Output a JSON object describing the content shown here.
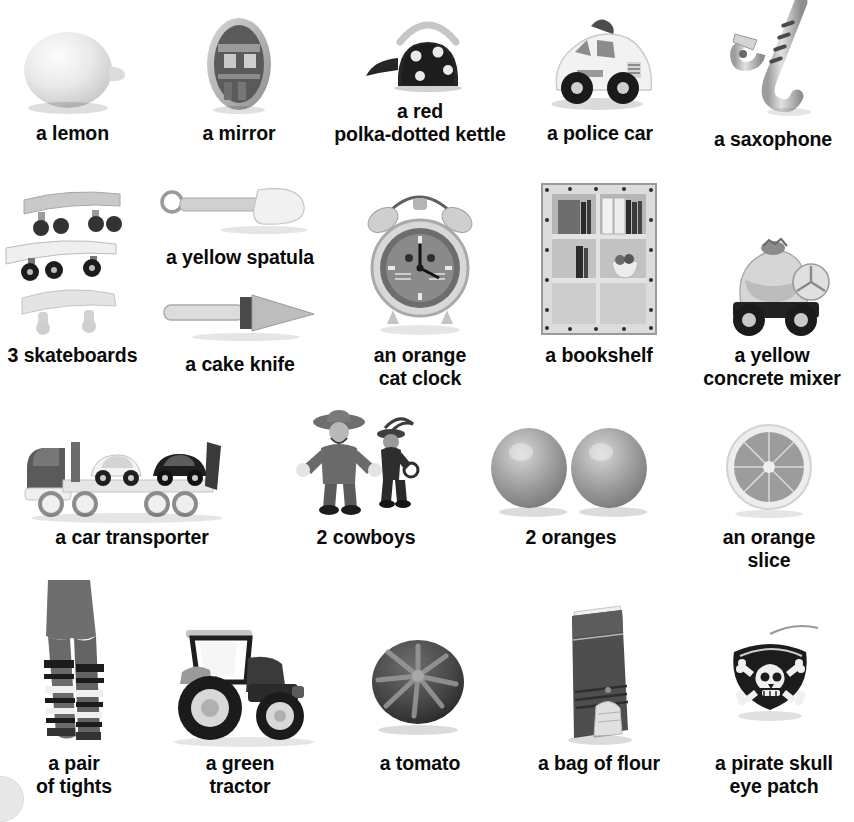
{
  "page": {
    "background_color": "#ffffff",
    "text_color": "#0a0a0a",
    "columns": 5,
    "rows": 4
  },
  "rows": [
    {
      "index": 1,
      "items": [
        {
          "caption": "a lemon",
          "icon": "lemon-icon",
          "col": 1
        },
        {
          "caption": "a mirror",
          "icon": "mirror-icon",
          "col": 2
        },
        {
          "caption": "a red\npolka-dotted kettle",
          "icon": "kettle-icon",
          "col": 3
        },
        {
          "caption": "a police car",
          "icon": "police-car-icon",
          "col": 4
        },
        {
          "caption": "a saxophone",
          "icon": "saxophone-icon",
          "col": 5
        }
      ]
    },
    {
      "index": 2,
      "items": [
        {
          "caption": "3 skateboards",
          "icon": "skateboards-icon",
          "col": 1
        },
        {
          "caption": "a yellow spatula",
          "icon": "spatula-icon",
          "col": 2
        },
        {
          "caption": "a cake knife",
          "icon": "cake-knife-icon",
          "col": 2
        },
        {
          "caption": "an orange\ncat clock",
          "icon": "cat-clock-icon",
          "col": 3
        },
        {
          "caption": "a bookshelf",
          "icon": "bookshelf-icon",
          "col": 4
        },
        {
          "caption": "a yellow\nconcrete mixer",
          "icon": "concrete-mixer-icon",
          "col": 5
        }
      ]
    },
    {
      "index": 3,
      "items": [
        {
          "caption": "a car transporter",
          "icon": "car-transporter-icon",
          "col": 1
        },
        {
          "caption": "2 cowboys",
          "icon": "cowboys-icon",
          "col": 2
        },
        {
          "caption": "2 oranges",
          "icon": "oranges-icon",
          "col": 3
        },
        {
          "caption": "an orange\nslice",
          "icon": "orange-slice-icon",
          "col": 4
        }
      ]
    },
    {
      "index": 4,
      "items": [
        {
          "caption": "a pair\nof tights",
          "icon": "tights-icon",
          "col": 1
        },
        {
          "caption": "a green\ntractor",
          "icon": "tractor-icon",
          "col": 2
        },
        {
          "caption": "a tomato",
          "icon": "tomato-icon",
          "col": 3
        },
        {
          "caption": "a bag of flour",
          "icon": "bag-of-flour-icon",
          "col": 4
        },
        {
          "caption": "a pirate skull\neye patch",
          "icon": "pirate-eye-patch-icon",
          "col": 5
        }
      ]
    }
  ]
}
